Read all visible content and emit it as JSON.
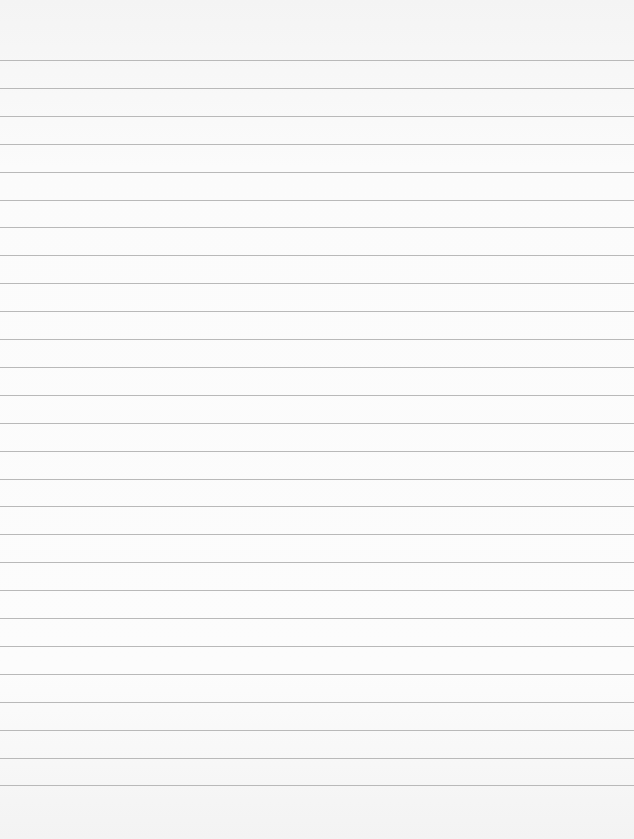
{
  "paper": {
    "type": "ruled-sheet",
    "background_color": "#fbfbfb",
    "line_color": "#b9b9b9",
    "first_line_y": 60,
    "line_spacing": 27.9,
    "line_count": 27,
    "text": ""
  }
}
